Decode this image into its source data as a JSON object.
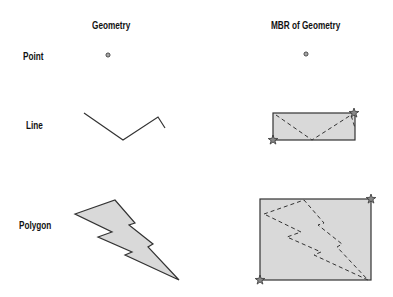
{
  "headers": {
    "geometry": "Geometry",
    "mbr": "MBR of Geometry"
  },
  "rows": [
    {
      "label": "Point"
    },
    {
      "label": "Line"
    },
    {
      "label": "Polygon"
    }
  ],
  "colors": {
    "stroke": "#333333",
    "fill": "#d9d9d9",
    "star": "#888888"
  }
}
